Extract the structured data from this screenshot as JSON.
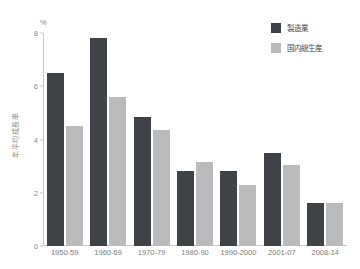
{
  "chart_data": {
    "type": "bar",
    "title": "",
    "subtitle": "",
    "xlabel": "",
    "ylabel": "年平均成長率",
    "unit_label": "%",
    "ylim": [
      0,
      8
    ],
    "yticks": [
      0,
      2,
      4,
      6,
      8
    ],
    "ytick_labels": [
      "0",
      "2",
      "4",
      "6",
      "8"
    ],
    "grid": false,
    "legend_position": "top-right",
    "categories": [
      "1950-59",
      "1960-69",
      "1970-79",
      "1980-90",
      "1990-2000",
      "2001-07",
      "2008-14"
    ],
    "series": [
      {
        "name": "製造業",
        "color": "#3f4246",
        "values": [
          6.5,
          7.8,
          4.85,
          2.8,
          2.8,
          3.5,
          1.6
        ]
      },
      {
        "name": "国内総生産",
        "color": "#b9bbbc",
        "values": [
          4.5,
          5.6,
          4.35,
          3.15,
          2.3,
          3.05,
          1.6
        ]
      }
    ]
  },
  "colors": {
    "background": "#ffffff",
    "axis": "#c8c8c8",
    "tick_text": "#8a8a8a",
    "category_text": "#7d7d7d",
    "legend_text": "#4a4a4a"
  }
}
